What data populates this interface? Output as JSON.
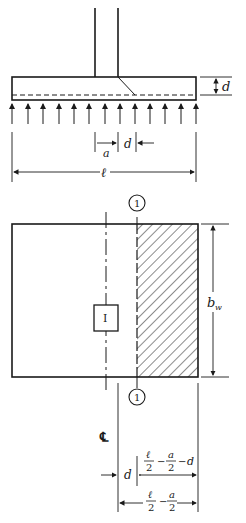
{
  "diagram": {
    "elevation": {
      "depth_label": "d",
      "column_offset_a_label": "a",
      "column_offset_d_label": "d",
      "length_label": "ℓ"
    },
    "plan": {
      "section_marker_top": "1",
      "section_marker_bottom": "1",
      "column_marker": "I",
      "width_label": "b",
      "width_subscript": "w",
      "centerline_label": "℄",
      "d_label": "d",
      "dim1": {
        "num1": "ℓ",
        "den1": "2",
        "minus1": "−",
        "num2": "a",
        "den2": "2",
        "minus2": "−",
        "tail": "d"
      },
      "dim2": {
        "num1": "ℓ",
        "den1": "2",
        "minus1": "−",
        "num2": "a",
        "den2": "2"
      }
    },
    "colors": {
      "ink": "#1a1a1a",
      "background": "#ffffff"
    }
  }
}
